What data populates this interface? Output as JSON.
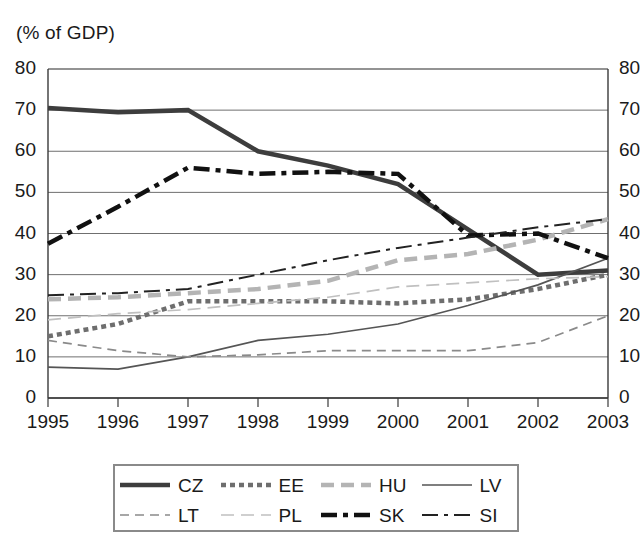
{
  "chart_data": {
    "type": "line",
    "title": "(% of GDP)",
    "xlabel": "",
    "ylabel": "(% of GDP)",
    "ylim": [
      0,
      80
    ],
    "ytick_step": 10,
    "yticks": [
      "0",
      "10",
      "20",
      "30",
      "40",
      "50",
      "60",
      "70",
      "80"
    ],
    "grid": true,
    "grid_axis": "y",
    "dual_y_axis": true,
    "legend_position": "bottom",
    "categories": [
      "1995",
      "1996",
      "1997",
      "1998",
      "1999",
      "2000",
      "2001",
      "2002",
      "2003"
    ],
    "x": [
      1995,
      1996,
      1997,
      1998,
      1999,
      2000,
      2001,
      2002,
      2003
    ],
    "series": [
      {
        "name": "CZ",
        "label": "CZ",
        "style": "solid-thick",
        "color": "#3d3d3d",
        "values": [
          70.5,
          69.5,
          70.0,
          60.0,
          56.5,
          52.0,
          41.0,
          30.0,
          31.0
        ]
      },
      {
        "name": "EE",
        "label": "EE",
        "style": "dotted-thick",
        "color": "#6e6e6e",
        "values": [
          15.0,
          18.0,
          23.5,
          23.5,
          23.5,
          23.0,
          24.0,
          26.5,
          30.0
        ]
      },
      {
        "name": "HU",
        "label": "HU",
        "style": "dashed-thick",
        "color": "#b4b4b4",
        "values": [
          24.0,
          24.5,
          25.5,
          26.5,
          28.5,
          33.5,
          35.0,
          38.5,
          43.5
        ]
      },
      {
        "name": "LV",
        "label": "LV",
        "style": "solid-thin",
        "color": "#555555",
        "values": [
          7.5,
          7.0,
          10.0,
          14.0,
          15.5,
          18.0,
          22.5,
          27.5,
          34.0
        ]
      },
      {
        "name": "LT",
        "label": "LT",
        "style": "dashed-thin",
        "color": "#8a8a8a",
        "values": [
          14.0,
          11.5,
          10.0,
          10.5,
          11.5,
          11.5,
          11.5,
          13.5,
          20.0
        ]
      },
      {
        "name": "PL",
        "label": "PL",
        "style": "dashed-thin-light",
        "color": "#c0c0c0",
        "values": [
          19.0,
          20.5,
          21.5,
          23.0,
          24.5,
          27.0,
          28.0,
          29.0,
          29.5
        ]
      },
      {
        "name": "SK",
        "label": "SK",
        "style": "dashdot-thick",
        "color": "#111111",
        "values": [
          37.5,
          46.5,
          56.0,
          54.5,
          55.0,
          54.5,
          39.5,
          40.0,
          34.0
        ]
      },
      {
        "name": "SI",
        "label": "SI",
        "style": "dashdot-thin",
        "color": "#222222",
        "values": [
          25.0,
          25.5,
          26.5,
          30.0,
          33.5,
          36.5,
          39.0,
          41.5,
          43.5
        ]
      }
    ]
  },
  "axes": {
    "left_ticks": [
      "80",
      "70",
      "60",
      "50",
      "40",
      "30",
      "20",
      "10",
      "0"
    ],
    "right_ticks": [
      "80",
      "70",
      "60",
      "50",
      "40",
      "30",
      "20",
      "10",
      "0"
    ],
    "x_ticks": [
      "1995",
      "1996",
      "1997",
      "1998",
      "1999",
      "2000",
      "2001",
      "2002",
      "2003"
    ]
  },
  "legend": {
    "rows": [
      [
        {
          "label": "CZ",
          "style": "solid-thick"
        },
        {
          "label": "EE",
          "style": "dotted-thick"
        },
        {
          "label": "HU",
          "style": "dashed-thick"
        },
        {
          "label": "LV",
          "style": "solid-thin"
        }
      ],
      [
        {
          "label": "LT",
          "style": "dashed-thin"
        },
        {
          "label": "PL",
          "style": "dashed-thin-light"
        },
        {
          "label": "SK",
          "style": "dashdot-thick"
        },
        {
          "label": "SI",
          "style": "dashdot-thin"
        }
      ]
    ]
  },
  "colors": {
    "background": "#ffffff",
    "axis": "#3a3a3a",
    "grid": "#6f6f6f",
    "text": "#1a1a1a",
    "legend_border": "#8a8a8a"
  }
}
